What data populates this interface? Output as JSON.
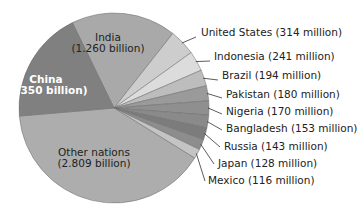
{
  "chart_data": {
    "type": "pie",
    "title": "",
    "unit": "million people",
    "start_angle_deg": -116,
    "direction": "clockwise",
    "slices": [
      {
        "label": "India",
        "value": 1260,
        "display": "India",
        "display2": "(1.260 billion)",
        "color": "#a9a9a9",
        "inside": true,
        "bold": false,
        "text_color": "#222222",
        "tx": 108,
        "ty": 41
      },
      {
        "label": "United States",
        "value": 314,
        "display": "United States (314 million)",
        "color": "#cdcdcd",
        "inside": false,
        "lx": 201,
        "ly": 36,
        "ex": 196,
        "ey": 37
      },
      {
        "label": "Indonesia",
        "value": 241,
        "display": "Indonesia (241 million)",
        "color": "#dcdcdc",
        "inside": false,
        "lx": 214,
        "ly": 60,
        "ex": 210,
        "ey": 61
      },
      {
        "label": "Brazil",
        "value": 194,
        "display": "Brazil (194 million)",
        "color": "#bdbdbd",
        "inside": false,
        "lx": 222,
        "ly": 79,
        "ex": 218,
        "ey": 80
      },
      {
        "label": "Pakistan",
        "value": 180,
        "display": "Pakistan (180 million)",
        "color": "#9a9a9a",
        "inside": false,
        "lx": 226,
        "ly": 98,
        "ex": 222,
        "ey": 98
      },
      {
        "label": "Nigeria",
        "value": 170,
        "display": "Nigeria (170 million)",
        "color": "#8f8f8f",
        "inside": false,
        "lx": 226,
        "ly": 115,
        "ex": 222,
        "ey": 114
      },
      {
        "label": "Bangladesh",
        "value": 153,
        "display": "Bangladesh (153 million)",
        "color": "#8a8a8a",
        "inside": false,
        "lx": 226,
        "ly": 132,
        "ex": 222,
        "ey": 130
      },
      {
        "label": "Russia",
        "value": 143,
        "display": "Russia (143 million)",
        "color": "#7c7c7c",
        "inside": false,
        "lx": 224,
        "ly": 150,
        "ex": 220,
        "ey": 147
      },
      {
        "label": "Japan",
        "value": 128,
        "display": "Japan (128 million)",
        "color": "#8d8d8d",
        "inside": false,
        "lx": 218,
        "ly": 167,
        "ex": 214,
        "ey": 164
      },
      {
        "label": "Mexico",
        "value": 116,
        "display": "Mexico (116 million)",
        "color": "#c4c4c4",
        "inside": false,
        "lx": 208,
        "ly": 184,
        "ex": 205,
        "ey": 181
      },
      {
        "label": "Other nations",
        "value": 2809,
        "display": "Other nations",
        "display2": "(2.809 billion)",
        "color": "#adadad",
        "inside": true,
        "bold": false,
        "text_color": "#222222",
        "tx": 94,
        "ty": 156
      },
      {
        "label": "China",
        "value": 1350,
        "display": "China",
        "display2": "(1.350 billion)",
        "color": "#808080",
        "inside": true,
        "bold": true,
        "text_color": "#ffffff",
        "tx": 46,
        "ty": 83
      }
    ],
    "legend": "none (direct labels)"
  },
  "layout": {
    "cx": 114,
    "cy": 108,
    "r": 95
  }
}
